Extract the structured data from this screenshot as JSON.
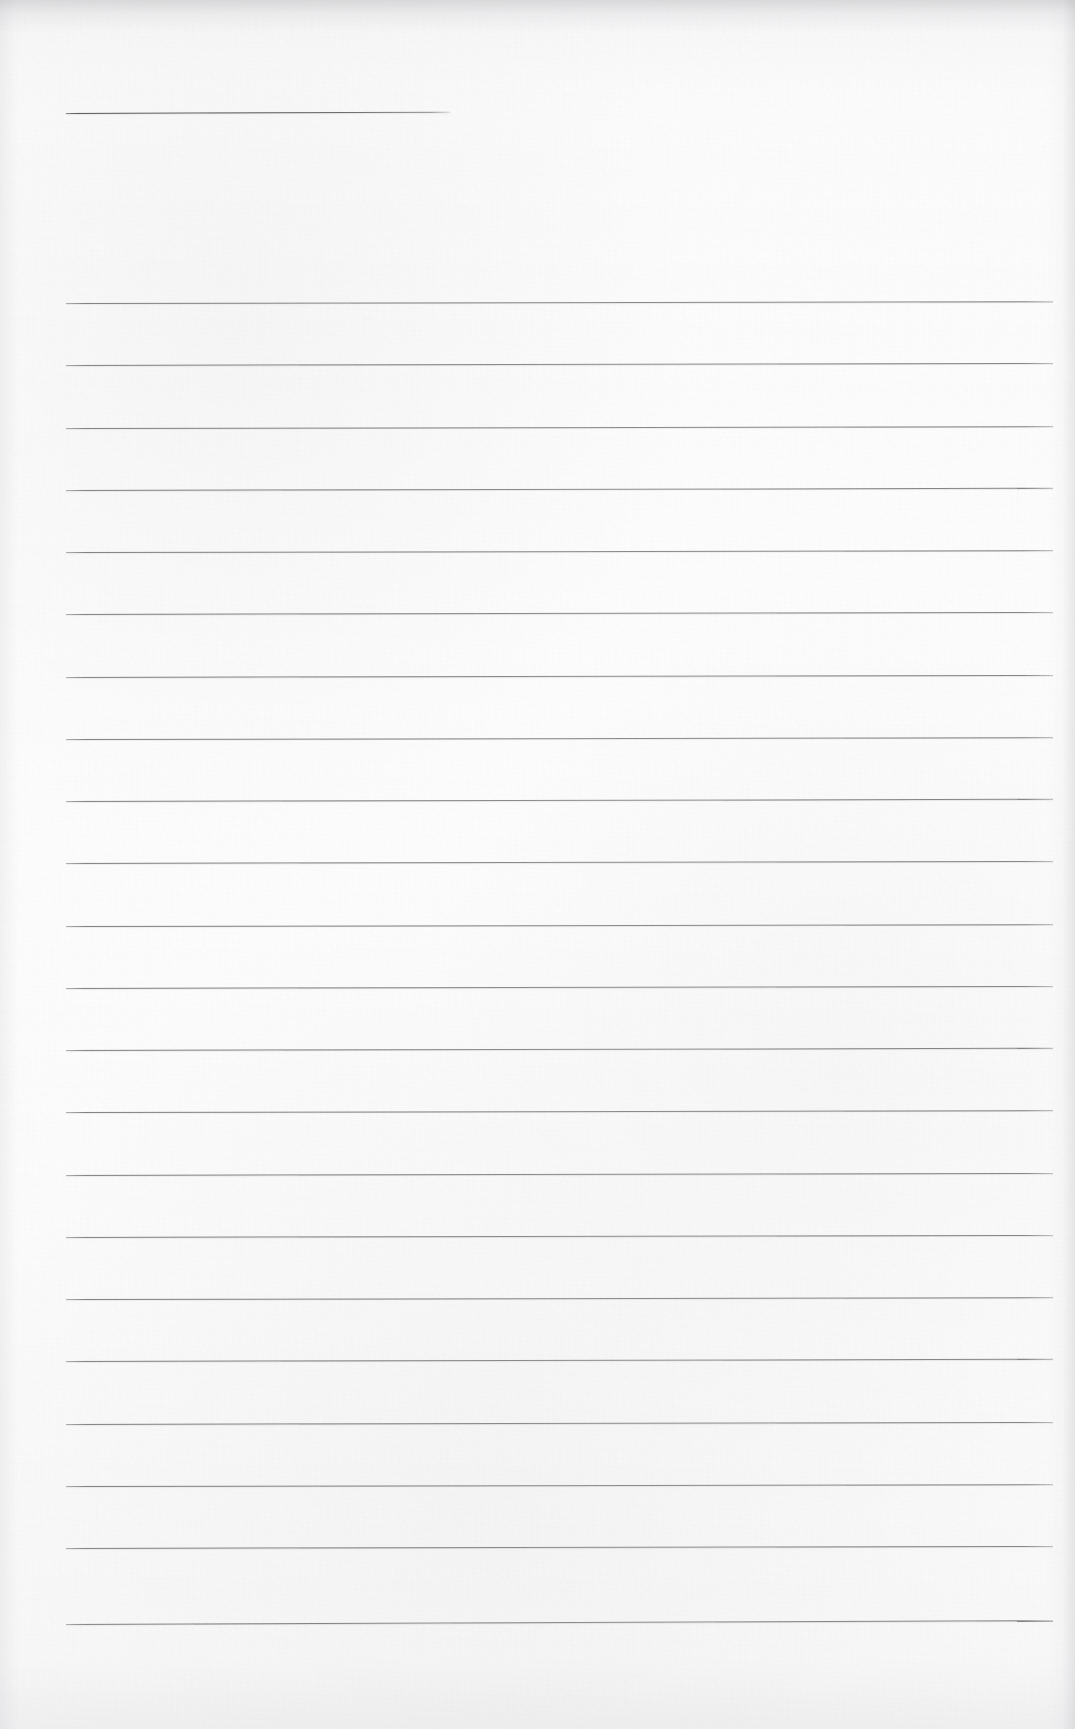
{
  "document": {
    "type": "scanned-lined-paper",
    "title": "",
    "body_text": "",
    "page_number": "",
    "width_px": 1075,
    "height_px": 1729,
    "is_blank": true
  },
  "paper": {
    "background_color": "#fcfcfc",
    "rule_color": "#86868a",
    "heading_rule_color": "#5a5a5e",
    "shadow_color": "#96969b",
    "texture": "scanned-paper-grain"
  },
  "ruling": {
    "left_margin_px": 66,
    "right_edge_px": 1053,
    "line_spacing_px": 62.9,
    "first_full_line_y_px": 303,
    "last_full_line_y_px": 1624,
    "full_line_count": 22,
    "tilt_deg": -0.12
  },
  "heading_rule": {
    "label": "heading-rule",
    "x_px": 66,
    "y_px": 113,
    "width_px": 384,
    "tilt_deg": -0.2
  },
  "lines": [
    {
      "index": 1,
      "y": 303,
      "x": 66,
      "width": 987,
      "tilt": -0.1
    },
    {
      "index": 2,
      "y": 365,
      "x": 66,
      "width": 987,
      "tilt": -0.12
    },
    {
      "index": 3,
      "y": 428,
      "x": 66,
      "width": 987,
      "tilt": -0.11
    },
    {
      "index": 4,
      "y": 490,
      "x": 66,
      "width": 987,
      "tilt": -0.13
    },
    {
      "index": 5,
      "y": 552,
      "x": 66,
      "width": 987,
      "tilt": -0.11
    },
    {
      "index": 6,
      "y": 614,
      "x": 66,
      "width": 987,
      "tilt": -0.12
    },
    {
      "index": 7,
      "y": 677,
      "x": 66,
      "width": 987,
      "tilt": -0.12
    },
    {
      "index": 8,
      "y": 739,
      "x": 66,
      "width": 987,
      "tilt": -0.11
    },
    {
      "index": 9,
      "y": 801,
      "x": 66,
      "width": 987,
      "tilt": -0.13
    },
    {
      "index": 10,
      "y": 863,
      "x": 66,
      "width": 987,
      "tilt": -0.12
    },
    {
      "index": 11,
      "y": 926,
      "x": 66,
      "width": 987,
      "tilt": -0.11
    },
    {
      "index": 12,
      "y": 988,
      "x": 66,
      "width": 987,
      "tilt": -0.12
    },
    {
      "index": 13,
      "y": 1050,
      "x": 66,
      "width": 987,
      "tilt": -0.13
    },
    {
      "index": 14,
      "y": 1112,
      "x": 66,
      "width": 987,
      "tilt": -0.11
    },
    {
      "index": 15,
      "y": 1175,
      "x": 66,
      "width": 987,
      "tilt": -0.12
    },
    {
      "index": 16,
      "y": 1237,
      "x": 66,
      "width": 987,
      "tilt": -0.12
    },
    {
      "index": 17,
      "y": 1299,
      "x": 66,
      "width": 987,
      "tilt": -0.11
    },
    {
      "index": 18,
      "y": 1361,
      "x": 66,
      "width": 987,
      "tilt": -0.13
    },
    {
      "index": 19,
      "y": 1424,
      "x": 66,
      "width": 987,
      "tilt": -0.12
    },
    {
      "index": 20,
      "y": 1486,
      "x": 66,
      "width": 987,
      "tilt": -0.11
    },
    {
      "index": 21,
      "y": 1548,
      "x": 66,
      "width": 987,
      "tilt": -0.12
    },
    {
      "index": 22,
      "y": 1624,
      "x": 66,
      "width": 987,
      "tilt": -0.22
    }
  ]
}
